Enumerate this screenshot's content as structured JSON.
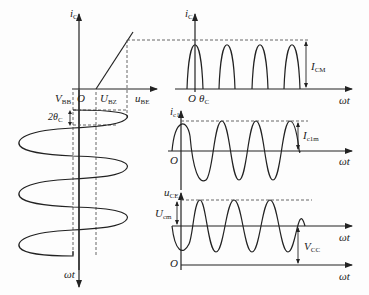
{
  "diagram": {
    "colors": {
      "stroke": "#222222",
      "dashed": "#444444",
      "background": "#fdfdfd"
    },
    "left_panel": {
      "y_axis_label": {
        "main": "i",
        "sub": "C"
      },
      "x_axis_label": {
        "main": "u",
        "sub": "BE"
      },
      "origin_label": "O",
      "vbb_label": {
        "main": "V",
        "sub": "BB"
      },
      "ubz_label": {
        "main": "U",
        "sub": "BZ"
      },
      "conduction_angle_label": {
        "main": "2θ",
        "sub": "C"
      },
      "time_axis_label": "ωt"
    },
    "top_right_panel": {
      "y_axis_label": {
        "main": "i",
        "sub": "C"
      },
      "origin_label": "O",
      "theta_label": {
        "main": "θ",
        "sub": "C"
      },
      "amplitude_label": {
        "main": "I",
        "sub": "CM"
      },
      "x_axis_label": "ωt",
      "pulse_count": 4
    },
    "middle_right_panel": {
      "y_axis_label": {
        "main": "i",
        "sub": "c1"
      },
      "origin_label": "O",
      "amplitude_label": {
        "main": "I",
        "sub": "c1m"
      },
      "x_axis_label": "ωt",
      "cycles": 4
    },
    "bottom_right_panel": {
      "y_axis_label": {
        "main": "u",
        "sub": "CE"
      },
      "origin_label": "O",
      "amplitude_label": {
        "main": "U",
        "sub": "cm"
      },
      "dc_label": {
        "main": "V",
        "sub": "CC"
      },
      "x_axis_label": "ωt",
      "cycles": 4
    }
  }
}
